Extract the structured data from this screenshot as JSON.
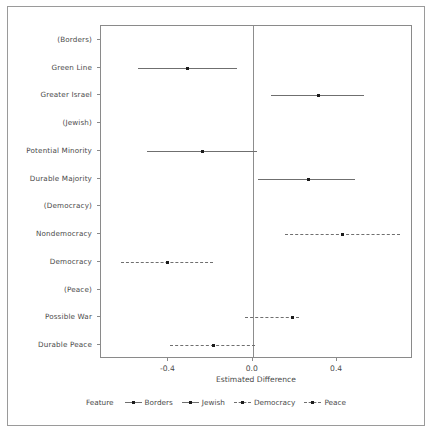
{
  "chart_data": {
    "type": "scatter",
    "title": "",
    "xlabel": "Estimated Difference",
    "ylabel": "",
    "xlim": [
      -0.72,
      0.76
    ],
    "xticks": [
      -0.4,
      0.0,
      0.4
    ],
    "xticklabels": [
      "-0.4",
      "0.0",
      "0.4"
    ],
    "grid": false,
    "legend_position": "bottom",
    "legend_title": "Feature",
    "reference_line_x": 0.0,
    "categories": [
      "(Borders)",
      "Green Line",
      "Greater Israel",
      "(Jewish)",
      "Potential Minority",
      "Durable Majority",
      "(Democracy)",
      "Nondemocracy",
      "Democracy",
      "(Peace)",
      "Possible War",
      "Durable Peace"
    ],
    "series": [
      {
        "name": "Borders",
        "linestyle": "solid",
        "points": [
          {
            "category": "(Borders)",
            "estimate": null,
            "low": null,
            "high": null
          },
          {
            "category": "Green Line",
            "estimate": -0.31,
            "low": -0.545,
            "high": -0.075
          },
          {
            "category": "Greater Israel",
            "estimate": 0.31,
            "low": 0.085,
            "high": 0.53
          }
        ]
      },
      {
        "name": "Jewish",
        "linestyle": "solid",
        "points": [
          {
            "category": "(Jewish)",
            "estimate": null,
            "low": null,
            "high": null
          },
          {
            "category": "Potential Minority",
            "estimate": -0.238,
            "low": -0.5,
            "high": 0.02
          },
          {
            "category": "Durable Majority",
            "estimate": 0.262,
            "low": 0.025,
            "high": 0.485
          }
        ]
      },
      {
        "name": "Democracy",
        "linestyle": "dashdot",
        "points": [
          {
            "category": "(Democracy)",
            "estimate": null,
            "low": null,
            "high": null
          },
          {
            "category": "Nondemocracy",
            "estimate": 0.424,
            "low": 0.152,
            "high": 0.7
          },
          {
            "category": "Democracy",
            "estimate": -0.405,
            "low": -0.625,
            "high": -0.19
          }
        ]
      },
      {
        "name": "Peace",
        "linestyle": "dashdot",
        "points": [
          {
            "category": "(Peace)",
            "estimate": null,
            "low": null,
            "high": null
          },
          {
            "category": "Possible War",
            "estimate": 0.19,
            "low": -0.036,
            "high": 0.219
          },
          {
            "category": "Durable Peace",
            "estimate": -0.186,
            "low": -0.395,
            "high": 0.012
          }
        ]
      }
    ]
  },
  "axis": {
    "x_title": "Estimated Difference",
    "x_tick_labels": [
      "-0.4",
      "0.0",
      "0.4"
    ],
    "y_tick_labels": [
      "(Borders)",
      "Green Line",
      "Greater Israel",
      "(Jewish)",
      "Potential Minority",
      "Durable Majority",
      "(Democracy)",
      "Nondemocracy",
      "Democracy",
      "(Peace)",
      "Possible War",
      "Durable Peace"
    ]
  },
  "legend": {
    "title": "Feature",
    "entries": [
      {
        "label": "Borders",
        "style": "solid"
      },
      {
        "label": "Jewish",
        "style": "solid"
      },
      {
        "label": "Democracy",
        "style": "dashdot"
      },
      {
        "label": "Peace",
        "style": "dashdot"
      }
    ]
  },
  "colors": {
    "line": "#6f6f6f",
    "point": "#1b1b1b",
    "axis": "#8a8a8a",
    "text": "#4a4a4a",
    "background": "#ffffff",
    "figure_border": "#9a9a9a"
  }
}
